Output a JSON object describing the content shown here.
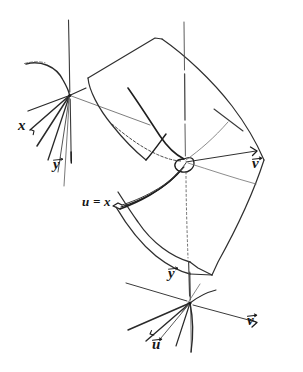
{
  "figure": {
    "kind": "hand-drawn-mathematical-diagram",
    "background_color": "#ffffff",
    "ink_color": "#1a1a1a",
    "faint_ink_color": "#6b6b6b",
    "width": 303,
    "height": 372
  },
  "labels": {
    "source_x": "x",
    "source_y": "y",
    "fold_map": "u = x",
    "target_v_upper": "v",
    "target_y": "y",
    "target_u": "u",
    "target_v_lower": "v"
  },
  "frames": {
    "source": {
      "name": "source-coordinate-frame",
      "origin": [
        70,
        95
      ],
      "axis_labels": [
        "x",
        "y"
      ]
    },
    "target": {
      "name": "target-coordinate-frame",
      "origin": [
        190,
        303
      ],
      "axis_labels": [
        "y",
        "u",
        "v"
      ]
    }
  },
  "surface": {
    "name": "folded-surface-sheet",
    "fold_curve_label": "u = x"
  }
}
